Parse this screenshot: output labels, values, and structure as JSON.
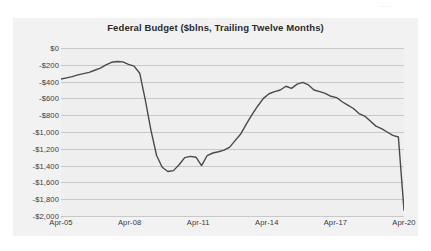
{
  "page": {
    "background_color": "#ffffff",
    "top_sliver_text": "......"
  },
  "chart": {
    "title": "Federal Budget ($blns, Trailing Twelve Months)",
    "frame_color": "#f2f2f2",
    "plot_background_color": "#efefef",
    "gridline_color": "#c9c9c9",
    "line_color": "#4a4a4a",
    "y_tick_labels": [
      "$0",
      "-$200",
      "-$400",
      "-$600",
      "-$800",
      "-$1,000",
      "-$1,200",
      "-$1,400",
      "-$1,600",
      "-$1,800",
      "-$2,000"
    ],
    "x_tick_labels": [
      "Apr-05",
      "Apr-08",
      "Apr-11",
      "Apr-14",
      "Apr-17",
      "Apr-20"
    ]
  },
  "chart_data": {
    "type": "line",
    "title": "Federal Budget ($blns, Trailing Twelve Months)",
    "xlabel": "",
    "ylabel": "",
    "grid": true,
    "legend": "none",
    "ylim": [
      -2000,
      0
    ],
    "yticks": [
      0,
      -200,
      -400,
      -600,
      -800,
      -1000,
      -1200,
      -1400,
      -1600,
      -1800,
      -2000
    ],
    "ytick_labels": [
      "$0",
      "-$200",
      "-$400",
      "-$600",
      "-$800",
      "-$1,000",
      "-$1,200",
      "-$1,400",
      "-$1,600",
      "-$1,800",
      "-$2,000"
    ],
    "xticks": [
      "Apr-05",
      "Apr-08",
      "Apr-11",
      "Apr-14",
      "Apr-17",
      "Apr-20"
    ],
    "xlim": [
      "Apr-05",
      "Apr-20"
    ],
    "series": [
      {
        "name": "Federal Budget (TTM)",
        "color": "#4a4a4a",
        "x": [
          "Apr-05",
          "Jul-05",
          "Oct-05",
          "Jan-06",
          "Apr-06",
          "Jul-06",
          "Oct-06",
          "Jan-07",
          "Apr-07",
          "Jul-07",
          "Oct-07",
          "Jan-08",
          "Apr-08",
          "Jul-08",
          "Oct-08",
          "Jan-09",
          "Apr-09",
          "Jul-09",
          "Oct-09",
          "Jan-10",
          "Apr-10",
          "Jul-10",
          "Oct-10",
          "Jan-11",
          "Apr-11",
          "Jul-11",
          "Oct-11",
          "Jan-12",
          "Apr-12",
          "Jul-12",
          "Oct-12",
          "Jan-13",
          "Apr-13",
          "Jul-13",
          "Oct-13",
          "Jan-14",
          "Apr-14",
          "Jul-14",
          "Oct-14",
          "Jan-15",
          "Apr-15",
          "Jul-15",
          "Oct-15",
          "Jan-16",
          "Apr-16",
          "Jul-16",
          "Oct-16",
          "Jan-17",
          "Apr-17",
          "Jul-17",
          "Oct-17",
          "Jan-18",
          "Apr-18",
          "Jul-18",
          "Oct-18",
          "Jan-19",
          "Apr-19",
          "Jul-19",
          "Oct-19",
          "Jan-20",
          "Mar-20",
          "Apr-20"
        ],
        "y": [
          -370,
          -355,
          -340,
          -320,
          -305,
          -290,
          -265,
          -240,
          -200,
          -170,
          -160,
          -165,
          -195,
          -215,
          -300,
          -620,
          -980,
          -1280,
          -1420,
          -1470,
          -1460,
          -1390,
          -1305,
          -1290,
          -1300,
          -1400,
          -1280,
          -1250,
          -1235,
          -1215,
          -1180,
          -1100,
          -1020,
          -900,
          -790,
          -690,
          -600,
          -545,
          -520,
          -500,
          -455,
          -480,
          -430,
          -410,
          -440,
          -500,
          -520,
          -540,
          -575,
          -590,
          -640,
          -680,
          -720,
          -780,
          -810,
          -870,
          -930,
          -960,
          -1000,
          -1040,
          -1060,
          -1930
        ],
        "note": "Values in $billions, trailing twelve months; final point drops sharply to roughly -$1,930."
      }
    ],
    "annotations": [
      {
        "text": "peak (smallest deficit) ≈ -$155 around late 2007"
      },
      {
        "text": "trough ≈ -$1,470 around early 2010"
      },
      {
        "text": "secondary local peak ≈ -$410 around 2015-2016"
      },
      {
        "text": "final vertical plunge from ≈ -$1,050 to ≈ -$1,930 at Apr-20"
      }
    ]
  }
}
